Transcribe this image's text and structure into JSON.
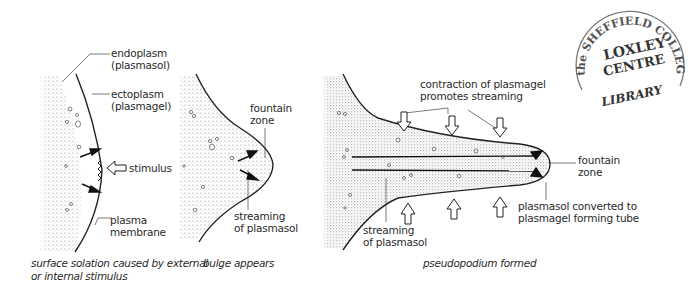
{
  "figure": {
    "panels": [
      {
        "id": "panel-1",
        "labels": {
          "endoplasm": "endoplasm",
          "endoplasm_alt": "(plasmasol)",
          "ectoplasm": "ectoplasm",
          "ectoplasm_alt": "(plasmagel)",
          "stimulus": "stimulus",
          "plasma": "plasma",
          "membrane": "membrane"
        },
        "caption_line1": "surface solation  caused by external",
        "caption_line2": "or internal stimulus"
      },
      {
        "id": "panel-2",
        "labels": {
          "fountain": "fountain",
          "zone": "zone",
          "streaming": "streaming",
          "of_plasmasol": "of plasmasol"
        },
        "caption": "bulge appears"
      },
      {
        "id": "panel-3",
        "labels": {
          "contraction_line1": "contraction of plasmagel",
          "contraction_line2": "promotes streaming",
          "fountain": "fountain",
          "zone": "zone",
          "converted_line1": "plasmasol converted to",
          "converted_line2": "plasmagel forming tube",
          "streaming": "streaming",
          "of_plasmasol": "of plasmasol"
        },
        "caption": "pseudopodium formed"
      }
    ],
    "stamp": {
      "arc_top": "the SHEFFIELD COLLEGE",
      "line1": "LOXLEY",
      "line2": "CENTRE",
      "bottom": "LIBRARY"
    }
  }
}
